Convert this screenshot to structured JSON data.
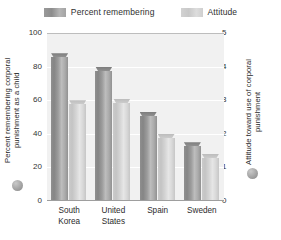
{
  "legend": {
    "entries": [
      {
        "label": "Percent remembering",
        "swatch": "dark-swatch-icon",
        "color": "#8d8d8d"
      },
      {
        "label": "Attitude",
        "swatch": "light-swatch-icon",
        "color": "#cfcfcf"
      }
    ]
  },
  "axes": {
    "left": {
      "title": "Percent remembering corporal punishment as a child",
      "ticks": [
        "100",
        "80",
        "60",
        "40",
        "20",
        "0"
      ],
      "min": 0,
      "max": 100
    },
    "right": {
      "title": "Attitude toward use of corporal punishment",
      "ticks": [
        "5",
        "4",
        "3",
        "2",
        "1",
        "0"
      ],
      "min": 0,
      "max": 5
    }
  },
  "categories_display": [
    "South\nKorea",
    "United\nStates",
    "Spain",
    "Sweden"
  ],
  "chart_data": {
    "type": "bar",
    "title": "",
    "subtitle": "",
    "xlabel": "",
    "ylabel": "Percent remembering corporal punishment as a child",
    "y2label": "Attitude toward use of corporal punishment",
    "categories": [
      "South Korea",
      "United States",
      "Spain",
      "Sweden"
    ],
    "series": [
      {
        "name": "Percent remembering",
        "axis": "left",
        "color": "#8d8d8d",
        "values": [
          88,
          80,
          53,
          35
        ]
      },
      {
        "name": "Attitude",
        "axis": "right",
        "color": "#cfcfcf",
        "values": [
          3.0,
          3.05,
          2.0,
          1.4
        ]
      }
    ],
    "ylim": [
      0,
      100
    ],
    "y2lim": [
      0,
      5
    ],
    "yticks": [
      0,
      20,
      40,
      60,
      80,
      100
    ],
    "y2ticks": [
      0,
      1,
      2,
      3,
      4,
      5
    ],
    "grid": true,
    "legend_position": "top",
    "bar_style": "3d-cylinder",
    "plot_background": "#f1f1f1"
  }
}
